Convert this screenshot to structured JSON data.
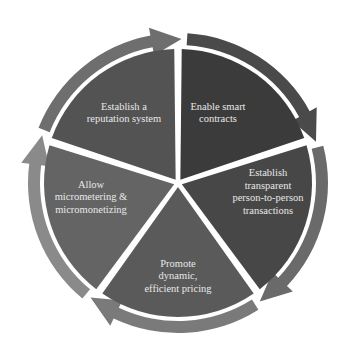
{
  "diagram": {
    "type": "cycle",
    "center": [
      178,
      183
    ],
    "segments": [
      {
        "label_lines": [
          "Enable smart",
          "contracts"
        ],
        "fill": "#3b3b3b",
        "band": "#4a4a4a",
        "text_pos": [
          218,
          113
        ]
      },
      {
        "label_lines": [
          "Establish",
          "transparent",
          "person-to-person",
          "transactions"
        ],
        "fill": "#474747",
        "band": "#6a6a6a",
        "text_pos": [
          268,
          192
        ]
      },
      {
        "label_lines": [
          "Promote",
          "dynamic,",
          "efficient pricing"
        ],
        "fill": "#5a5a5a",
        "band": "#7a7a7a",
        "text_pos": [
          178,
          276
        ]
      },
      {
        "label_lines": [
          "Allow",
          "micrometering &",
          "micromonetizing"
        ],
        "fill": "#646464",
        "band": "#8a8a8a",
        "text_pos": [
          91,
          197
        ]
      },
      {
        "label_lines": [
          "Establish a",
          "reputation system"
        ],
        "fill": "#535353",
        "band": "#6e6e6e",
        "text_pos": [
          124,
          113
        ]
      }
    ]
  }
}
